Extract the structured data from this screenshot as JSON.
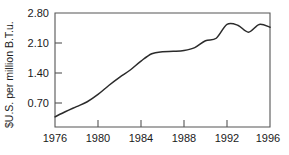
{
  "chart_data": {
    "type": "line",
    "title": "",
    "subtitle": "",
    "xlabel": "",
    "ylabel": "$U.S. per million B.T.u.",
    "xlim": [
      1976,
      1996
    ],
    "ylim": [
      0.0,
      2.8
    ],
    "grid": false,
    "legend": false,
    "legend_position": "none",
    "x_ticks": [
      "1976",
      "1980",
      "1984",
      "1988",
      "1992",
      "1996"
    ],
    "x_tick_values": [
      1976,
      1980,
      1984,
      1988,
      1992,
      1996
    ],
    "y_ticks": [
      "0.70",
      "1.40",
      "2.10",
      "2.80"
    ],
    "y_tick_values": [
      0.7,
      1.4,
      2.1,
      2.8
    ],
    "series": [
      {
        "name": "Price",
        "x": [
          1976,
          1977,
          1978,
          1979,
          1980,
          1981,
          1982,
          1983,
          1984,
          1985,
          1986,
          1987,
          1988,
          1989,
          1990,
          1991,
          1992,
          1993,
          1994,
          1995,
          1996
        ],
        "values": [
          0.25,
          0.38,
          0.5,
          0.62,
          0.8,
          1.02,
          1.22,
          1.4,
          1.62,
          1.8,
          1.85,
          1.86,
          1.88,
          1.95,
          2.12,
          2.18,
          2.52,
          2.5,
          2.33,
          2.52,
          2.45
        ]
      }
    ]
  },
  "axis": {
    "y_title": "$U.S. per million B.T.u."
  }
}
